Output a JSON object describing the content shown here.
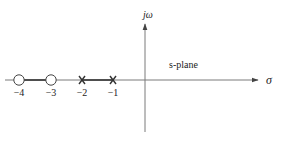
{
  "diagram": {
    "type": "root-locus / pole-zero plot",
    "axes": {
      "imag_label": "jω",
      "real_label": "σ",
      "plane_label": "s-plane"
    },
    "zeros": [
      {
        "value": -4,
        "label": "−4"
      },
      {
        "value": -3,
        "label": "−3"
      }
    ],
    "poles": [
      {
        "value": -2,
        "label": "−2"
      },
      {
        "value": -1,
        "label": "−1"
      }
    ],
    "locus_segments": [
      {
        "from": -4,
        "to": -3
      },
      {
        "from": -2,
        "to": -1
      }
    ],
    "colors": {
      "axis": "#6e6e6e",
      "locus": "#333333",
      "text": "#222222"
    }
  }
}
